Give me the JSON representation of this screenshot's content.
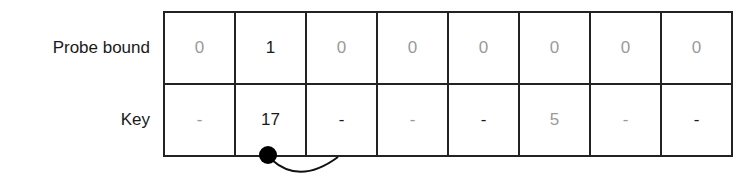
{
  "rows": [
    {
      "label": "Probe bound",
      "cells": [
        {
          "value": "0",
          "style": "dim"
        },
        {
          "value": "1",
          "style": "dark"
        },
        {
          "value": "0",
          "style": "dim"
        },
        {
          "value": "0",
          "style": "dim"
        },
        {
          "value": "0",
          "style": "dim"
        },
        {
          "value": "0",
          "style": "dim"
        },
        {
          "value": "0",
          "style": "dim"
        },
        {
          "value": "0",
          "style": "dim"
        }
      ]
    },
    {
      "label": "Key",
      "cells": [
        {
          "value": "-",
          "style": "dim"
        },
        {
          "value": "17",
          "style": "dark"
        },
        {
          "value": "-",
          "style": "dark"
        },
        {
          "value": "-",
          "style": "dim"
        },
        {
          "value": "-",
          "style": "dark"
        },
        {
          "value": "5",
          "style": "dim"
        },
        {
          "value": "-",
          "style": "dim"
        },
        {
          "value": "-",
          "style": "dark"
        }
      ]
    }
  ],
  "annotation": {
    "type": "probe-link",
    "from_index": 1,
    "to_index": 2
  }
}
